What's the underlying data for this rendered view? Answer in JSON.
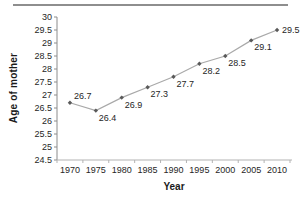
{
  "page": {
    "background": "#ffffff",
    "top_rule_color": "#8e8e8e"
  },
  "chart_data": {
    "type": "line",
    "title": "",
    "xlabel": "Year",
    "ylabel": "Age of mother",
    "categories": [
      "1970",
      "1975",
      "1980",
      "1985",
      "1990",
      "1995",
      "2000",
      "2005",
      "2010"
    ],
    "series": [
      {
        "name": "Age of mother",
        "values": [
          26.7,
          26.4,
          26.9,
          27.3,
          27.7,
          28.2,
          28.5,
          29.1,
          29.5
        ]
      }
    ],
    "point_labels": [
      "26.7",
      "26.4",
      "26.9",
      "27.3",
      "27.7",
      "28.2",
      "28.5",
      "29.1",
      "29.5"
    ],
    "label_placement": [
      "above-right",
      "below-right",
      "below-right",
      "below-right",
      "below-right",
      "below-right",
      "below-right",
      "below-right",
      "right"
    ],
    "ylim": [
      24.5,
      30
    ],
    "ytick_step": 0.5,
    "ytick_labels": [
      "30",
      "29.5",
      "29",
      "28.5",
      "28",
      "27.5",
      "27",
      "26.5",
      "26",
      "25.5",
      "25",
      "24.5"
    ],
    "grid": "off",
    "legend": "none",
    "marker_shape": "diamond",
    "colors": {
      "line": "#a9a9a9",
      "marker": "#595959",
      "axis": "#8c8c8c",
      "x_axis_line": "#b3b3b3",
      "text": "#262626"
    }
  }
}
